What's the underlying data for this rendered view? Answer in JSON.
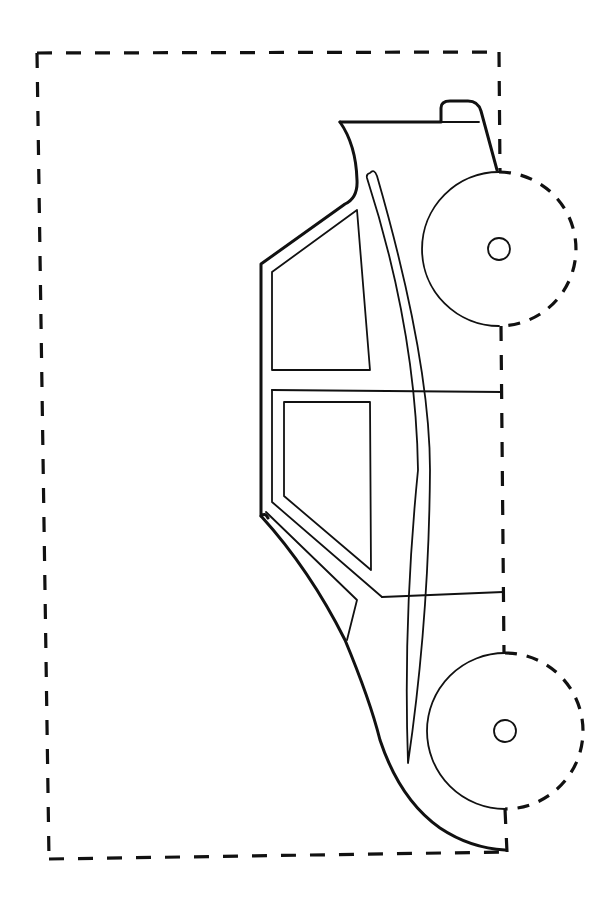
{
  "drawing": {
    "stroke_color": "#111111",
    "background": "#ffffff",
    "cut_border": {
      "style": "dashed",
      "corners": [
        [
          37,
          53
        ],
        [
          499,
          52
        ],
        [
          507,
          852
        ],
        [
          49,
          859
        ]
      ]
    },
    "wheels": [
      {
        "name": "front-wheel",
        "center": [
          499,
          249
        ],
        "radius": 77,
        "hub_radius": 11,
        "left_half": "solid",
        "right_half": "dashed"
      },
      {
        "name": "rear-wheel",
        "center": [
          505,
          731
        ],
        "radius": 78,
        "hub_radius": 11,
        "left_half": "solid",
        "right_half": "dashed"
      }
    ],
    "parts": [
      "hood",
      "roof-bump",
      "front-window",
      "rear-window",
      "door-lines",
      "fender-sliver",
      "rear-trim"
    ]
  }
}
